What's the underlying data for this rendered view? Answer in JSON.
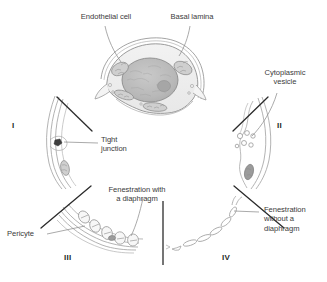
{
  "figure": {
    "background_color": "#ffffff",
    "line_color": "#8a8a8a",
    "dark_line_color": "#2a2a2a",
    "text_color": "#3a3a3a"
  },
  "labels": {
    "endothelial_cell": "Endothelial cell",
    "basal_lamina": "Basal lamina",
    "cytoplasmic_vesicle": "Cytoplasmic\nvesicle",
    "tight_junction": "Tight\njunction",
    "fenestration_with_diaphragm": "Fenestration with\na diaphragm",
    "pericyte": "Pericyte",
    "fenestration_without_diaphragm": "Fenestration\nwithout a\ndiaphragm"
  },
  "panels": [
    {
      "numeral": "I",
      "name": "continuous-capillary-tight-junction"
    },
    {
      "numeral": "II",
      "name": "continuous-capillary-vesicles"
    },
    {
      "numeral": "III",
      "name": "fenestrated-capillary-with-diaphragm"
    },
    {
      "numeral": "IV",
      "name": "fenestrated-capillary-without-diaphragm"
    }
  ],
  "center": {
    "name": "endothelial-cell-cross-section",
    "parts": [
      "basal-lamina",
      "cytoplasm",
      "nucleus",
      "nucleolus",
      "mitochondria"
    ]
  }
}
